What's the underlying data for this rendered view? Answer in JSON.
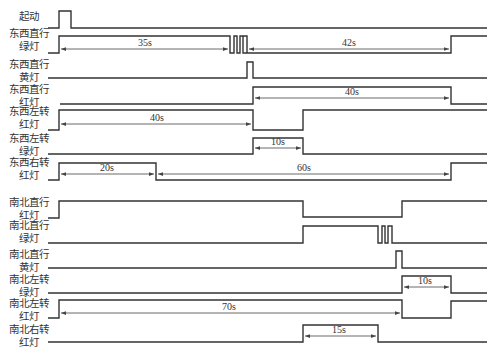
{
  "signals": [
    {
      "label": "起动"
    },
    {
      "label": "东西直行\n绿灯"
    },
    {
      "label": "东西直行\n黄灯"
    },
    {
      "label": "东西直行\n红灯"
    },
    {
      "label": "东西左转\n红灯"
    },
    {
      "label": "东西左转\n绿灯"
    },
    {
      "label": "东西右转\n红灯"
    },
    {
      "label": "南北直行\n红灯"
    },
    {
      "label": "南北直行\n绿灯"
    },
    {
      "label": "南北直行\n黄灯"
    },
    {
      "label": "南北左转\n绿灯"
    },
    {
      "label": "南北左转\n红灯"
    },
    {
      "label": "南北右转\n红灯"
    }
  ],
  "durations": {
    "ew_straight_green": "35s",
    "ew_straight_green_2": "42s",
    "ew_straight_red": "40s",
    "ew_left_red": "40s",
    "ew_left_green": "10s",
    "ew_right_red_1": "20s",
    "ew_right_red_2": "60s",
    "ns_left_green": "10s",
    "ns_left_red": "70s",
    "ns_right_red": "15s"
  },
  "colors": {
    "line": "#333333",
    "background": "#ffffff"
  }
}
